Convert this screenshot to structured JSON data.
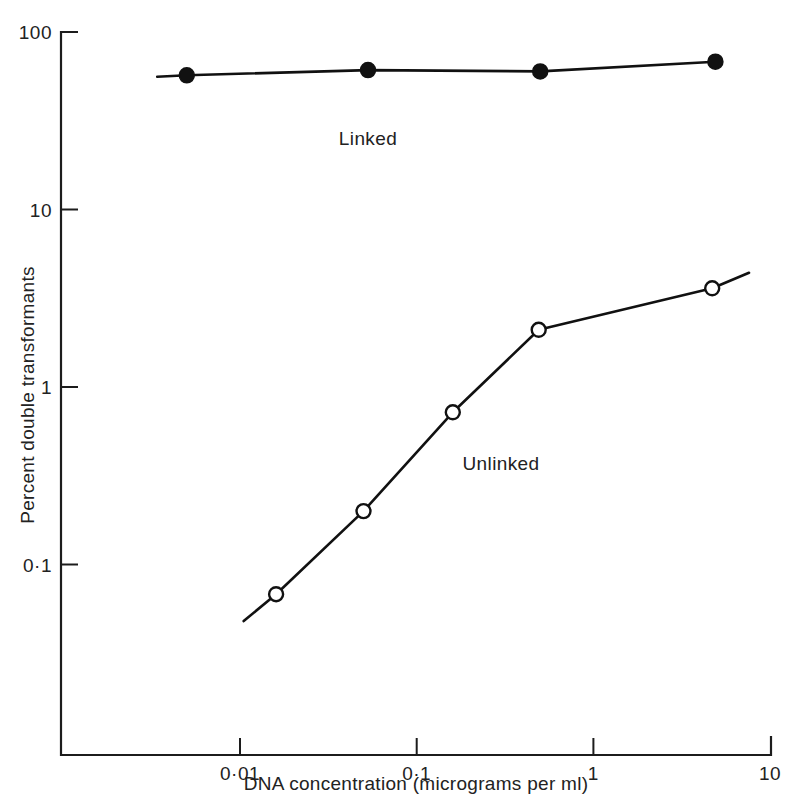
{
  "chart_data": {
    "type": "line",
    "title": "",
    "xlabel": "DNA concentration (micrograms per ml)",
    "ylabel": "Percent double transformants",
    "xscale": "log",
    "yscale": "log",
    "xlim": [
      0.003,
      10
    ],
    "ylim": [
      0.03,
      100
    ],
    "grid": false,
    "legend_position": "inline-annotations",
    "x_tick_labels": [
      "0·01",
      "0·1",
      "1",
      "10"
    ],
    "x_tick_values": [
      0.01,
      0.1,
      1,
      10
    ],
    "y_tick_labels": [
      "100",
      "10",
      "1",
      "0·1"
    ],
    "y_tick_values": [
      100,
      10,
      1,
      0.1
    ],
    "series": [
      {
        "name": "Linked",
        "marker": "filled-circle",
        "annotation": "Linked",
        "points": [
          {
            "x": 0.005,
            "y": 57
          },
          {
            "x": 0.053,
            "y": 61
          },
          {
            "x": 0.5,
            "y": 60
          },
          {
            "x": 4.9,
            "y": 68
          }
        ],
        "line_start": {
          "x": 0.0034,
          "y": 56
        },
        "line_end": {
          "x": 4.9,
          "y": 68
        }
      },
      {
        "name": "Unlinked",
        "marker": "open-circle",
        "annotation": "Unlinked",
        "points": [
          {
            "x": 0.016,
            "y": 0.068
          },
          {
            "x": 0.05,
            "y": 0.2
          },
          {
            "x": 0.16,
            "y": 0.72
          },
          {
            "x": 0.49,
            "y": 2.1
          },
          {
            "x": 4.7,
            "y": 3.6
          }
        ],
        "line_start": {
          "x": 0.0105,
          "y": 0.048
        },
        "line_end": {
          "x": 7.6,
          "y": 4.4
        }
      }
    ],
    "annotations": [
      {
        "text": "Linked",
        "x": 0.053,
        "y": 23
      },
      {
        "text": "Unlinked",
        "x": 0.3,
        "y": 0.34
      }
    ]
  }
}
